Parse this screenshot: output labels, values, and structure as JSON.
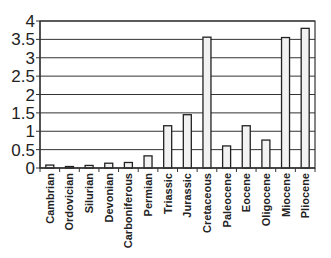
{
  "chart_data": {
    "type": "bar",
    "title": "",
    "xlabel": "",
    "ylabel": "",
    "categories": [
      "Cambrian",
      "Ordovician",
      "Silurian",
      "Devonian",
      "Carboniferous",
      "Permian",
      "Triassic",
      "Jurassic",
      "Cretaceous",
      "Paleocene",
      "Eocene",
      "Oligocene",
      "Miocene",
      "Pliocene"
    ],
    "values": [
      0.08,
      0.04,
      0.07,
      0.13,
      0.15,
      0.33,
      1.15,
      1.45,
      3.56,
      0.6,
      1.15,
      0.76,
      3.55,
      3.8
    ],
    "ylim": [
      0,
      4
    ],
    "yticks": [
      0,
      0.5,
      1,
      1.5,
      2,
      2.5,
      3,
      3.5,
      4
    ],
    "ytick_labels": [
      "0",
      "0.5",
      "1",
      "1.5",
      "2",
      "2.5",
      "3",
      "3.5",
      "4"
    ],
    "grid": true,
    "legend": null,
    "x_label_rotation": -90
  },
  "style": {
    "bar_fill": "#f2f2f2",
    "bar_stroke": "#222222",
    "grid_color": "#333333",
    "axis_color": "#333333"
  }
}
